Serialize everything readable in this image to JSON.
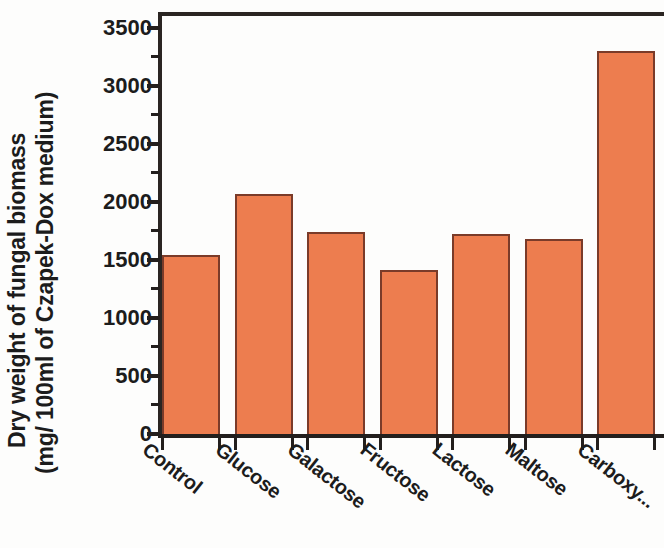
{
  "chart_data": {
    "type": "bar",
    "title": "",
    "xlabel": "",
    "ylabel": "Dry weight of fungal biomass (mg/ 100ml of Czapek-Dox medium)",
    "ylabel_lines": [
      "Dry weight of fungal biomass",
      "(mg/ 100ml of Czapek-Dox medium)"
    ],
    "categories": [
      "Control",
      "Glucose",
      "Galactose",
      "Fructose",
      "Lactose",
      "Maltose",
      "Carboxy..."
    ],
    "values": [
      1545,
      2065,
      1740,
      1415,
      1720,
      1680,
      3300
    ],
    "ylim": [
      0,
      3600
    ],
    "y_axis_max_tick": 3500,
    "yticks": [
      0,
      500,
      1000,
      1500,
      2000,
      2500,
      3000,
      3500
    ],
    "ytick_labels": [
      "0",
      "500",
      "1000",
      "1500",
      "2000",
      "2500",
      "3000",
      "3500"
    ],
    "minor_ticks": [
      250,
      750,
      1250,
      1750,
      2250,
      2750,
      3250
    ],
    "grid": false,
    "legend": null,
    "bar_color": "#ED7D4F",
    "bar_edge_color": "#7A3B29",
    "axis_color": "#231F1D"
  }
}
